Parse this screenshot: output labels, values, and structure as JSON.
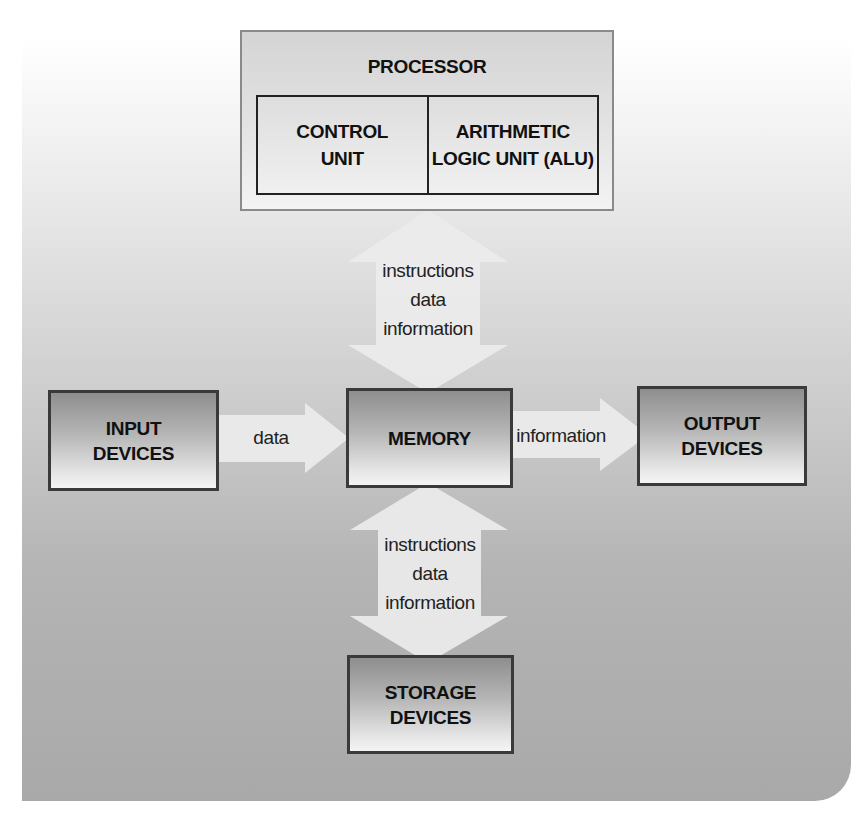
{
  "diagram": {
    "processor": {
      "title": "PROCESSOR",
      "components": [
        {
          "line1": "CONTROL",
          "line2": "UNIT"
        },
        {
          "line1": "ARITHMETIC",
          "line2": "LOGIC UNIT (ALU)"
        }
      ]
    },
    "memory": {
      "label": "MEMORY"
    },
    "input": {
      "line1": "INPUT",
      "line2": "DEVICES"
    },
    "output": {
      "line1": "OUTPUT",
      "line2": "DEVICES"
    },
    "storage": {
      "line1": "STORAGE",
      "line2": "DEVICES"
    },
    "arrows": {
      "processor_memory": {
        "direction": "bidirectional",
        "lines": [
          "instructions",
          "data",
          "information"
        ]
      },
      "input_memory": {
        "direction": "right",
        "label": "data"
      },
      "memory_output": {
        "direction": "right",
        "label": "information"
      },
      "memory_storage": {
        "direction": "bidirectional",
        "lines": [
          "instructions",
          "data",
          "information"
        ]
      }
    },
    "colors": {
      "arrow_fill": "#ececec",
      "box_border": "#3a3a3a",
      "text": "#111111"
    }
  }
}
